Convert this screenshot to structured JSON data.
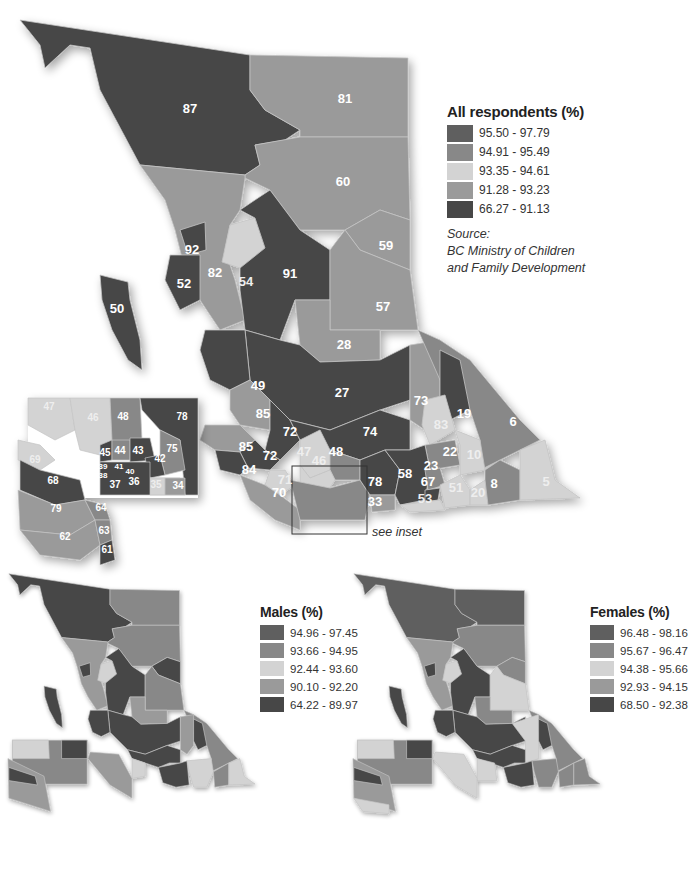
{
  "colors": {
    "c1": "#5f5f5f",
    "c2": "#8a8a8a",
    "c3": "#d2d2d2",
    "c4": "#9c9c9c",
    "c5": "#474747",
    "border": "#bcbcbc"
  },
  "main_map": {
    "legend": {
      "title": "All respondents (%)",
      "classes": [
        {
          "range": "95.50 - 97.79",
          "color": "#5f5f5f"
        },
        {
          "range": "94.91 - 95.49",
          "color": "#888888"
        },
        {
          "range": "93.35 - 94.61",
          "color": "#d3d3d3"
        },
        {
          "range": "91.28 - 93.23",
          "color": "#9a9a9a"
        },
        {
          "range": "66.27 - 91.13",
          "color": "#474747"
        }
      ]
    },
    "source": {
      "label": "Source:",
      "line1": "BC Ministry of Children",
      "line2": "and Family Development"
    },
    "see_inset": "see inset",
    "regions": [
      "87",
      "81",
      "60",
      "59",
      "57",
      "92",
      "82",
      "54",
      "91",
      "52",
      "50",
      "28",
      "27",
      "49",
      "85",
      "73",
      "19",
      "83",
      "6",
      "72",
      "74",
      "22",
      "10",
      "47",
      "48",
      "46",
      "85",
      "72",
      "84",
      "71",
      "70",
      "58",
      "23",
      "67",
      "78",
      "33",
      "53",
      "51",
      "20",
      "8",
      "5"
    ],
    "inset_regions": [
      "47",
      "46",
      "48",
      "78",
      "45",
      "44",
      "43",
      "42",
      "75",
      "39",
      "41",
      "40",
      "38",
      "37",
      "36",
      "35",
      "34",
      "69",
      "68",
      "79",
      "64",
      "63",
      "62",
      "61"
    ]
  },
  "males_map": {
    "legend": {
      "title": "Males (%)",
      "classes": [
        {
          "range": "94.96 - 97.45",
          "color": "#5f5f5f"
        },
        {
          "range": "93.66 - 94.95",
          "color": "#888888"
        },
        {
          "range": "92.44 - 93.60",
          "color": "#d3d3d3"
        },
        {
          "range": "90.10 - 92.20",
          "color": "#9a9a9a"
        },
        {
          "range": "64.22 - 89.97",
          "color": "#474747"
        }
      ]
    }
  },
  "females_map": {
    "legend": {
      "title": "Females (%)",
      "classes": [
        {
          "range": "96.48 - 98.16",
          "color": "#5f5f5f"
        },
        {
          "range": "95.67 - 96.47",
          "color": "#888888"
        },
        {
          "range": "94.38 - 95.66",
          "color": "#d3d3d3"
        },
        {
          "range": "92.93 - 94.15",
          "color": "#9a9a9a"
        },
        {
          "range": "68.50 - 92.38",
          "color": "#474747"
        }
      ]
    }
  },
  "labels": {
    "r87": "87",
    "r81": "81",
    "r60": "60",
    "r59": "59",
    "r57": "57",
    "r92": "92",
    "r82": "82",
    "r54": "54",
    "r91": "91",
    "r52": "52",
    "r50": "50",
    "r28": "28",
    "r27": "27",
    "r49": "49",
    "r85a": "85",
    "r73": "73",
    "r19": "19",
    "r83": "83",
    "r6": "6",
    "r72a": "72",
    "r74": "74",
    "r22": "22",
    "r10": "10",
    "r47": "47",
    "r48": "48",
    "r46": "46",
    "r85b": "85",
    "r72b": "72",
    "r84": "84",
    "r71": "71",
    "r70": "70",
    "r58": "58",
    "r23": "23",
    "r67": "67",
    "r78": "78",
    "r33": "33",
    "r53": "53",
    "r51": "51",
    "r20": "20",
    "r8": "8",
    "r5": "5",
    "i47": "47",
    "i46": "46",
    "i48": "48",
    "i78": "78",
    "i45": "45",
    "i44": "44",
    "i43": "43",
    "i42": "42",
    "i75": "75",
    "i39": "39",
    "i41": "41",
    "i40": "40",
    "i38": "38",
    "i37": "37",
    "i36": "36",
    "i35": "35",
    "i34": "34",
    "i69": "69",
    "i68": "68",
    "i79": "79",
    "i64": "64",
    "i63": "63",
    "i62": "62",
    "i61": "61"
  }
}
